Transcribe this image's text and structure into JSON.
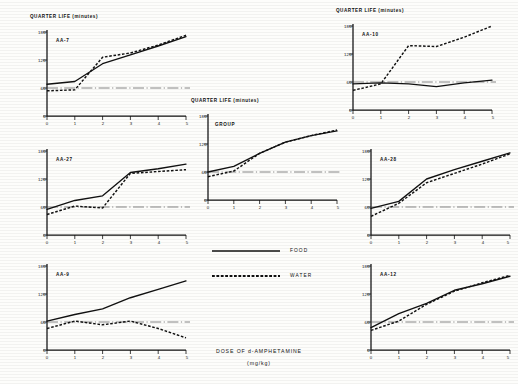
{
  "figure": {
    "y_axis_title": "QUARTER LIFE (minutes)",
    "x_axis_caption_line1": "DOSE OF d-AMPHETAMINE",
    "x_axis_caption_line2": "(mg/kg)"
  },
  "legend": {
    "food_label": "FOOD",
    "water_label": "WATER"
  },
  "ticks": {
    "y": [
      "180",
      "120",
      "60",
      "0"
    ],
    "x": [
      "0",
      "1",
      "2",
      "3",
      "4",
      "5"
    ]
  },
  "panels": [
    {
      "id": "aa-7",
      "label": "AA-7"
    },
    {
      "id": "aa-10",
      "label": "AA-10"
    },
    {
      "id": "aa-27",
      "label": "AA-27"
    },
    {
      "id": "group",
      "label": "GROUP"
    },
    {
      "id": "aa-28",
      "label": "AA-28"
    },
    {
      "id": "aa-9",
      "label": "AA-9"
    },
    {
      "id": "aa-12",
      "label": "AA-12"
    }
  ],
  "chart_data": {
    "type": "line",
    "xlabel": "DOSE OF d-AMPHETAMINE (mg/kg)",
    "ylabel": "QUARTER LIFE (minutes)",
    "xlim": [
      0,
      5
    ],
    "ylim": [
      0,
      180
    ],
    "xticks": [
      0,
      1,
      2,
      3,
      4,
      5
    ],
    "yticks": [
      0,
      60,
      120,
      180
    ],
    "grid": false,
    "legend_position": "center",
    "legend_entries": [
      "FOOD",
      "WATER"
    ],
    "reference_line": {
      "label": "control baseline",
      "y": 60,
      "style": "dash-dot"
    },
    "panels": [
      {
        "name": "AA-7",
        "x": [
          0,
          1,
          2,
          3,
          4,
          5
        ],
        "series": [
          {
            "name": "FOOD",
            "values": [
              68,
              74,
              112,
              131,
              150,
              170
            ]
          },
          {
            "name": "WATER",
            "values": [
              54,
              56,
              126,
              135,
              152,
              173
            ]
          }
        ]
      },
      {
        "name": "AA-10",
        "x": [
          0,
          1,
          2,
          3,
          4,
          5
        ],
        "series": [
          {
            "name": "FOOD",
            "values": [
              56,
              58,
              56,
              50,
              58,
              64
            ]
          },
          {
            "name": "WATER",
            "values": [
              42,
              56,
              138,
              136,
              156,
              180
            ]
          }
        ]
      },
      {
        "name": "AA-27",
        "x": [
          0,
          1,
          2,
          3,
          4,
          5
        ],
        "series": [
          {
            "name": "FOOD",
            "values": [
              55,
              74,
              84,
              134,
              142,
              152
            ]
          },
          {
            "name": "WATER",
            "values": [
              44,
              62,
              58,
              132,
              136,
              140
            ]
          }
        ]
      },
      {
        "name": "GROUP",
        "x": [
          0,
          1,
          2,
          3,
          4,
          5
        ],
        "series": [
          {
            "name": "FOOD",
            "values": [
              60,
              72,
              100,
              124,
              138,
              148
            ]
          },
          {
            "name": "WATER",
            "values": [
              50,
              62,
              100,
              124,
              138,
              150
            ]
          }
        ]
      },
      {
        "name": "AA-28",
        "x": [
          0,
          1,
          2,
          3,
          4,
          5
        ],
        "series": [
          {
            "name": "FOOD",
            "values": [
              57,
              72,
              120,
              140,
              158,
              176
            ]
          },
          {
            "name": "WATER",
            "values": [
              40,
              68,
              112,
              132,
              152,
              174
            ]
          }
        ]
      },
      {
        "name": "AA-9",
        "x": [
          0,
          1,
          2,
          3,
          4,
          5
        ],
        "series": [
          {
            "name": "FOOD",
            "values": [
              62,
              76,
              88,
              112,
              130,
              148
            ]
          },
          {
            "name": "WATER",
            "values": [
              46,
              62,
              54,
              62,
              46,
              26
            ]
          }
        ]
      },
      {
        "name": "AA-12",
        "x": [
          0,
          1,
          2,
          3,
          4,
          5
        ],
        "series": [
          {
            "name": "FOOD",
            "values": [
              48,
              78,
              100,
              128,
              142,
              158
            ]
          },
          {
            "name": "WATER",
            "values": [
              42,
              62,
              98,
              126,
              144,
              160
            ]
          }
        ]
      }
    ]
  }
}
